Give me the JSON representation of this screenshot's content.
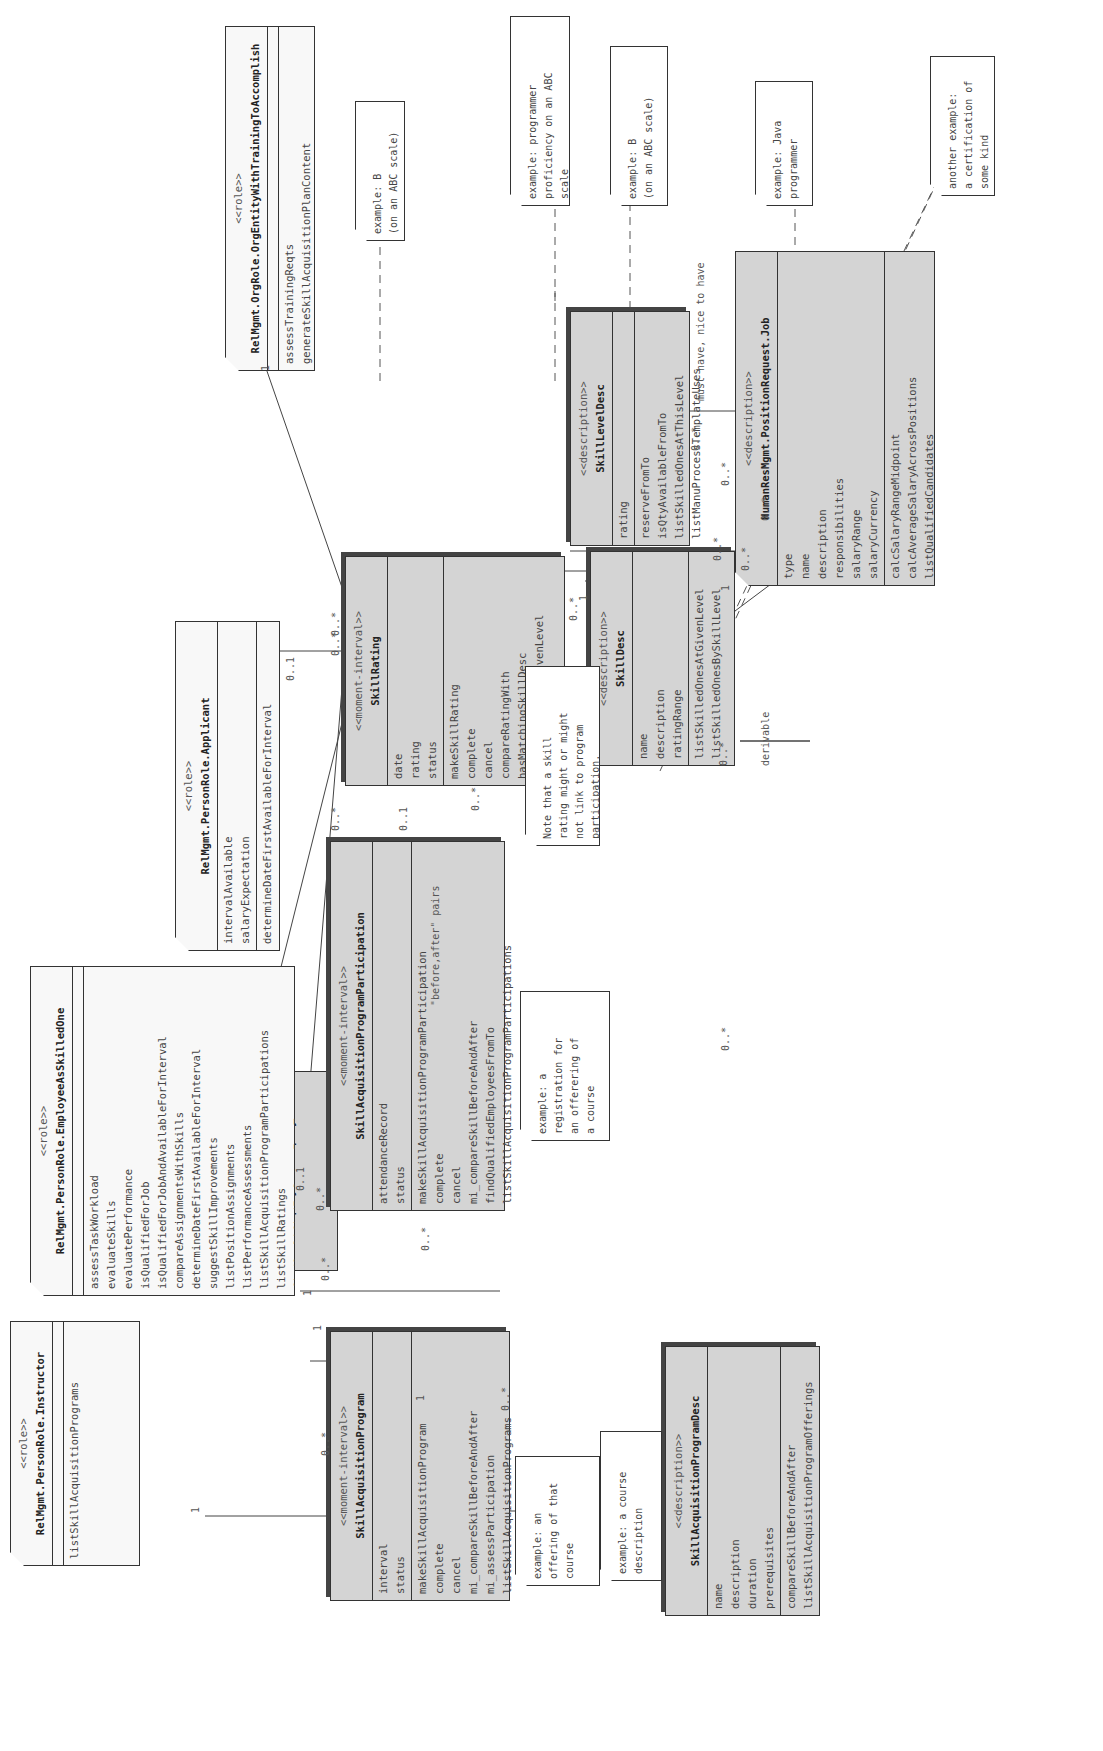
{
  "diagram": {
    "orientation": "rotated 90deg counter-clockwise",
    "classes": {
      "instructor": {
        "stereotype": "<<role>>",
        "name": "RelMgmt.PersonRole.Instructor",
        "attributes": [],
        "operations": [
          "listSkillAcquisitionPrograms"
        ]
      },
      "employment": {
        "stereotype": "<<moment-interval>>",
        "name": "...Employment.Employment",
        "attributes": [],
        "operations": []
      },
      "employee": {
        "stereotype": "<<role>>",
        "name": "RelMgmt.PersonRole.EmployeeAsSkilledOne",
        "attributes": [],
        "operations": [
          "assessTaskWorkload",
          "evaluateSkills",
          "evaluatePerformance",
          "isQualifiedForJob",
          "isQualifiedForJobAndAvailableForInterval",
          "compareAssignmentsWithSkills",
          "determineDateFirstAvailableForInterval",
          "suggestSkillImprovements",
          "listPositionAssignments",
          "listPerformanceAssessments",
          "listSkillAcquisitionProgramParticipations",
          "listSkillRatings",
          "findQualifiedEmployeesFromTo"
        ]
      },
      "applicant": {
        "stereotype": "<<role>>",
        "name": "RelMgmt.PersonRole.Applicant",
        "attributes": [
          "intervalAvailable",
          "salaryExpectation"
        ],
        "operations": [
          "determineDateFirstAvailableForInterval",
          "isQualifiedForJob",
          "isQualifiedForJobAndAvailableForInterval"
        ]
      },
      "orgEntity": {
        "stereotype": "<<role>>",
        "name": "RelMgmt.OrgRole.OrgEntityWithTrainingToAccomplish",
        "attributes": [],
        "operations": [
          "assessTrainingReqts",
          "generateSkillAcquisitionPlanContent"
        ]
      },
      "skillAcqProgram": {
        "stereotype": "<<moment-interval>>",
        "name": "SkillAcquisitionProgram",
        "attributes": [
          "interval",
          "status"
        ],
        "operations": [
          "makeSkillAcquisitionProgram",
          "complete",
          "cancel",
          "mi_compareSkillBeforeAndAfter",
          "mi_assessParticipation",
          "listSkillAcquisitionPrograms"
        ]
      },
      "skillAcqParticipation": {
        "stereotype": "<<moment-interval>>",
        "name": "SkillAcquisitionProgramParticipation",
        "attributes": [
          "attendanceRecord",
          "status"
        ],
        "operations": [
          "makeSkillAcquisitionProgramParticipation",
          "complete",
          "cancel",
          "mi_compareSkillBeforeAndAfter",
          "findQualifiedEmployeesFromTo",
          "listSkillAcquisitionProgramParticipations"
        ]
      },
      "skillRating": {
        "stereotype": "<<moment-interval>>",
        "name": "SkillRating",
        "attributes": [
          "date",
          "rating",
          "status"
        ],
        "operations": [
          "makeSkillRating",
          "complete",
          "cancel",
          "compareRatingWith",
          "hasMatchingSkillDesc",
          "listSkilledOneAtGivenLevel",
          "listSkillRatings"
        ]
      },
      "skillDesc": {
        "stereotype": "<<description>>",
        "name": "SkillDesc",
        "attributes": [
          "name",
          "description",
          "ratingRange"
        ],
        "operations": [
          "listSkilledOnesAtGivenLevel",
          "listSkilledOnesBySkillLevel"
        ]
      },
      "skillLevelDesc": {
        "stereotype": "<<description>>",
        "name": "SkillLevelDesc",
        "attributes": [
          "rating"
        ],
        "operations": [
          "reserveFromTo",
          "isQtyAvailableFromTo",
          "listSkilledOnesAtThisLevel",
          "listManuProcessTemplateUses"
        ]
      },
      "job": {
        "stereotype": "<<description>>",
        "name": "HumanResMgmt.PositionRequest.Job",
        "attributes": [
          "type",
          "name",
          "description",
          "responsibilities",
          "salaryRange",
          "salaryCurrency"
        ],
        "operations": [
          "calcSalaryRangeMidpoint",
          "calcAverageSalaryAcrossPositions",
          "listQualifiedCandidates",
          "listRequiredSkillLevelsAndSkills"
        ]
      },
      "programDesc": {
        "stereotype": "<<description>>",
        "name": "SkillAcquisitionProgramDesc",
        "attributes": [
          "name",
          "description",
          "duration",
          "prerequisites"
        ],
        "operations": [
          "compareSkillBeforeAndAfter",
          "listSkillAcquisitionProgramOfferings"
        ]
      }
    },
    "notes": {
      "offering": [
        "example: an",
        "offering of that",
        "course"
      ],
      "courseDesc": [
        "example: a course",
        "description"
      ],
      "registration": [
        "example: a",
        "registration for",
        "an offerering of",
        "a course"
      ],
      "ratingNote": [
        "Note that a skill",
        "rating might or might",
        "not link to program",
        "participation."
      ],
      "ratingB": [
        "example: B",
        "(on an ABC scale)"
      ],
      "proficiency": [
        "example: programmer",
        "proficiency on an ABC",
        "scale"
      ],
      "levelB": [
        "example: B",
        "(on an ABC scale)"
      ],
      "java": [
        "example: Java",
        "programmer"
      ],
      "certification": [
        "another example:",
        "a certification of",
        "some kind"
      ]
    },
    "labels": {
      "m_instr_1": "1",
      "m_prog_instr": "0..*",
      "m_emp_1": "1",
      "m_prog_emp": "0..*",
      "m_prog_1": "1",
      "m_part_prog": "0..*",
      "m_empl_1": "1",
      "m_part_empl": "0..*",
      "m_empl_01": "0..1",
      "m_rating_empl": "0..*",
      "m_appl_01": "0..1",
      "m_rating_appl": "0..*",
      "m_rating_org": "0..*",
      "m_org_1": "1",
      "m_part_01": "0..1",
      "m_rating_part": "0..*",
      "before_after": "\"before,after\" pairs",
      "m_rating_sd": "0..*",
      "m_sd_rating": "1",
      "m_sd_level": "1",
      "m_level_sd": "0..*",
      "m_sd_job": "0..*",
      "m_job_sd": "0..*",
      "m_level_job": "0..*",
      "m_job_level": "0..*",
      "must_have": "must have, nice to have",
      "derivable": "derivable",
      "m_pd_prog": "0..*",
      "m_pd_sd": "0..*",
      "m_sd_pd": "0..*"
    }
  }
}
